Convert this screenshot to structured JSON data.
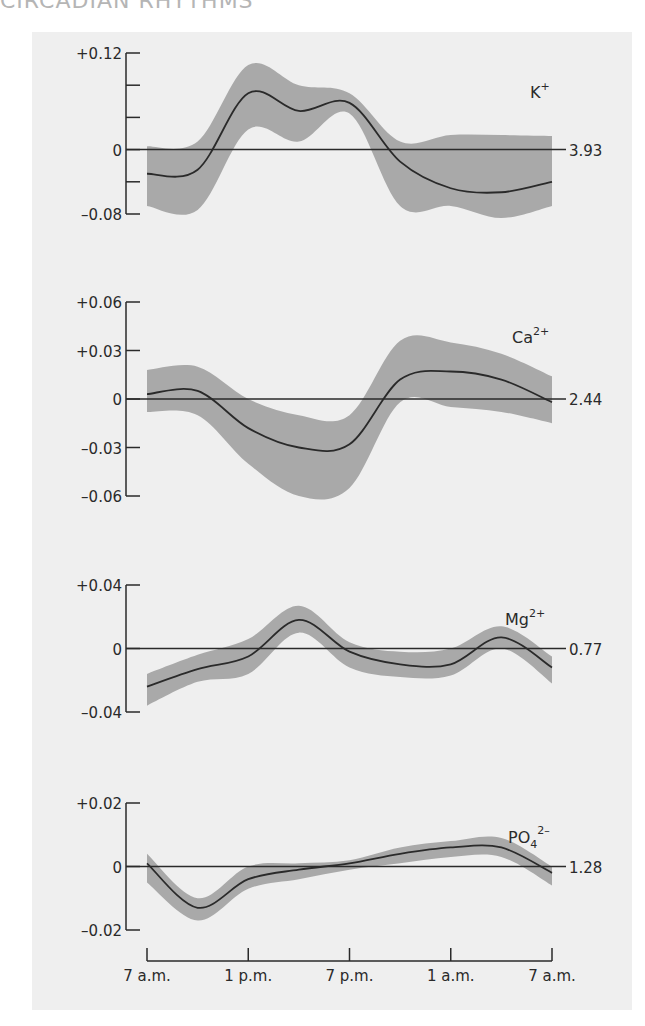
{
  "header": {
    "title": "CIRCADIAN RHYTHMS"
  },
  "chart_data": [
    {
      "type": "line",
      "title": "K+",
      "ion_label": "K",
      "ion_sup": "+",
      "baseline_label": "3.93",
      "ylim": [
        -0.08,
        0.12
      ],
      "yticks": [
        0.12,
        0.08,
        0.04,
        0,
        -0.04,
        -0.08
      ],
      "ytick_labels": [
        "+0.12",
        "",
        "",
        "0",
        "",
        "-0.08"
      ],
      "x": [
        0,
        3,
        6,
        9,
        12,
        15,
        18,
        21,
        24
      ],
      "series": [
        {
          "name": "mean",
          "values": [
            -0.03,
            -0.025,
            0.07,
            0.048,
            0.058,
            -0.015,
            -0.048,
            -0.053,
            -0.04
          ]
        },
        {
          "name": "upper",
          "values": [
            0.004,
            0.01,
            0.105,
            0.08,
            0.07,
            0.01,
            0.018,
            0.018,
            0.017
          ]
        },
        {
          "name": "lower",
          "values": [
            -0.07,
            -0.075,
            0.025,
            0.01,
            0.045,
            -0.07,
            -0.07,
            -0.085,
            -0.07
          ]
        }
      ]
    },
    {
      "type": "line",
      "title": "Ca2+",
      "ion_label": "Ca",
      "ion_sup": "2+",
      "baseline_label": "2.44",
      "ylim": [
        -0.06,
        0.06
      ],
      "yticks": [
        0.06,
        0.03,
        0,
        -0.03,
        -0.06
      ],
      "ytick_labels": [
        "+0.06",
        "+0.03",
        "0",
        "-0.03",
        "-0.06"
      ],
      "x": [
        0,
        3,
        6,
        9,
        12,
        15,
        18,
        21,
        24
      ],
      "series": [
        {
          "name": "mean",
          "values": [
            0.003,
            0.005,
            -0.018,
            -0.03,
            -0.028,
            0.012,
            0.017,
            0.012,
            -0.002
          ]
        },
        {
          "name": "upper",
          "values": [
            0.018,
            0.02,
            0.0,
            -0.01,
            -0.01,
            0.036,
            0.035,
            0.028,
            0.014
          ]
        },
        {
          "name": "lower",
          "values": [
            -0.008,
            -0.01,
            -0.04,
            -0.06,
            -0.055,
            -0.002,
            -0.005,
            -0.008,
            -0.015
          ]
        }
      ]
    },
    {
      "type": "line",
      "title": "Mg2+",
      "ion_label": "Mg",
      "ion_sup": "2+",
      "baseline_label": "0.77",
      "ylim": [
        -0.04,
        0.04
      ],
      "yticks": [
        0.04,
        0,
        -0.04
      ],
      "ytick_labels": [
        "+0.04",
        "0",
        "-0.04"
      ],
      "x": [
        0,
        3,
        6,
        9,
        12,
        15,
        18,
        21,
        24
      ],
      "series": [
        {
          "name": "mean",
          "values": [
            -0.024,
            -0.013,
            -0.005,
            0.018,
            -0.002,
            -0.01,
            -0.01,
            0.007,
            -0.012
          ]
        },
        {
          "name": "upper",
          "values": [
            -0.016,
            -0.004,
            0.006,
            0.027,
            0.004,
            -0.002,
            0.0,
            0.014,
            -0.005
          ]
        },
        {
          "name": "lower",
          "values": [
            -0.036,
            -0.021,
            -0.016,
            0.01,
            -0.012,
            -0.018,
            -0.017,
            0.0,
            -0.022
          ]
        }
      ]
    },
    {
      "type": "line",
      "title": "PO4 2-",
      "ion_label": "PO",
      "ion_sub": "4",
      "ion_sup": "2–",
      "baseline_label": "1.28",
      "ylim": [
        -0.02,
        0.02
      ],
      "yticks": [
        0.02,
        0,
        -0.02
      ],
      "ytick_labels": [
        "+0.02",
        "0",
        "-0.02"
      ],
      "x": [
        0,
        3,
        6,
        9,
        12,
        15,
        18,
        21,
        24
      ],
      "series": [
        {
          "name": "mean",
          "values": [
            0.001,
            -0.013,
            -0.004,
            -0.001,
            0.001,
            0.004,
            0.006,
            0.006,
            -0.002
          ]
        },
        {
          "name": "upper",
          "values": [
            0.004,
            -0.01,
            0.0,
            0.001,
            0.002,
            0.006,
            0.008,
            0.009,
            0.0
          ]
        },
        {
          "name": "lower",
          "values": [
            -0.005,
            -0.017,
            -0.007,
            -0.004,
            -0.001,
            0.001,
            0.003,
            0.003,
            -0.006
          ]
        }
      ]
    }
  ],
  "x_axis": {
    "ticks": [
      "7 a.m.",
      "1 p.m.",
      "7 p.m.",
      "1 a.m.",
      "7 a.m."
    ]
  },
  "colors": {
    "panel_bg": "#efefef",
    "band": "#a9a9a9",
    "line": "#2a2a2a"
  }
}
